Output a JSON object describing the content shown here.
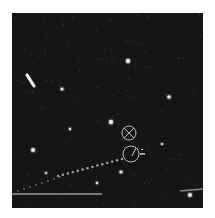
{
  "image": {
    "description": "Grayscale astronomical star field with a dotted satellite/debris trail, a horizontal streak, and two circular target markers",
    "background_color": "#151515",
    "frame_color": "#ffffff"
  },
  "markers": [
    {
      "type": "crossed-circle",
      "cx": 117,
      "cy": 120,
      "r": 7
    },
    {
      "type": "circle-with-tick",
      "cx": 119,
      "cy": 141,
      "r": 8,
      "label": "-"
    }
  ],
  "stars": [
    {
      "x": 116,
      "y": 48,
      "r": 2.2
    },
    {
      "x": 50,
      "y": 76,
      "r": 1.6
    },
    {
      "x": 157,
      "y": 84,
      "r": 1.8
    },
    {
      "x": 99,
      "y": 109,
      "r": 2.2
    },
    {
      "x": 21,
      "y": 137,
      "r": 2.0
    },
    {
      "x": 58,
      "y": 116,
      "r": 1.2
    },
    {
      "x": 109,
      "y": 159,
      "r": 1.6
    },
    {
      "x": 178,
      "y": 182,
      "r": 2.0
    },
    {
      "x": 34,
      "y": 160,
      "r": 1.1
    },
    {
      "x": 85,
      "y": 170,
      "r": 1.2
    },
    {
      "x": 150,
      "y": 131,
      "r": 1.1
    }
  ],
  "streak": {
    "x1": 15,
    "y1": 62,
    "x2": 22,
    "y2": 73
  },
  "trail": {
    "x1": 46,
    "y1": 163,
    "x2": 110,
    "y2": 146,
    "dots": 14
  },
  "horizontal_line": {
    "x1": 0,
    "y1": 181,
    "x2": 90,
    "y2": 181
  },
  "right_segment": {
    "x1": 168,
    "y1": 178,
    "x2": 191,
    "y2": 176
  }
}
